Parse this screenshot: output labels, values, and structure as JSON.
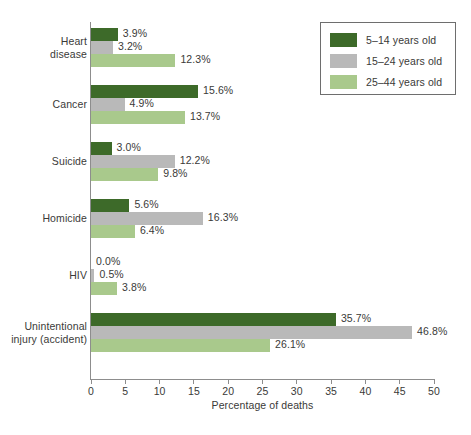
{
  "chart_data": {
    "type": "bar",
    "orientation": "horizontal",
    "title": "",
    "xlabel": "Percentage of deaths",
    "ylabel": "",
    "xlim": [
      0,
      50
    ],
    "xticks": [
      0,
      5,
      10,
      15,
      20,
      25,
      30,
      35,
      40,
      45,
      50
    ],
    "grid": false,
    "legend_position": "top-right",
    "categories": [
      "Heart disease",
      "Cancer",
      "Suicide",
      "Homicide",
      "HIV",
      "Unintentional injury (accident)"
    ],
    "category_label_lines": [
      [
        "Heart",
        "disease"
      ],
      [
        "Cancer"
      ],
      [
        "Suicide"
      ],
      [
        "Homicide"
      ],
      [
        "HIV"
      ],
      [
        "Unintentional",
        "injury (accident)"
      ]
    ],
    "series": [
      {
        "name": "5–14 years old",
        "color": "#3d6a29",
        "values": [
          3.9,
          15.6,
          3.0,
          5.6,
          0.0,
          35.7
        ],
        "labels": [
          "3.9%",
          "15.6%",
          "3.0%",
          "5.6%",
          "0.0%",
          "35.7%"
        ]
      },
      {
        "name": "15–24 years old",
        "color": "#b9b9b9",
        "values": [
          3.2,
          4.9,
          12.2,
          16.3,
          0.5,
          46.8
        ],
        "labels": [
          "3.2%",
          "4.9%",
          "12.2%",
          "16.3%",
          "0.5%",
          "46.8%"
        ]
      },
      {
        "name": "25–44 years old",
        "color": "#a9c98c",
        "values": [
          12.3,
          13.7,
          9.8,
          6.4,
          3.8,
          26.1
        ],
        "labels": [
          "12.3%",
          "13.7%",
          "9.8%",
          "6.4%",
          "3.8%",
          "26.1%"
        ]
      }
    ]
  },
  "legend": {
    "items": [
      {
        "label": "5–14 years old",
        "color": "#3d6a29"
      },
      {
        "label": "15–24 years old",
        "color": "#b9b9b9"
      },
      {
        "label": "25–44 years old",
        "color": "#a9c98c"
      }
    ]
  },
  "axis": {
    "x_title": "Percentage of deaths",
    "x_tick_labels": [
      "0",
      "5",
      "10",
      "15",
      "20",
      "25",
      "30",
      "35",
      "40",
      "45",
      "50"
    ]
  },
  "colors": {
    "series_1": "#3d6a29",
    "series_2": "#b9b9b9",
    "series_3": "#a9c98c",
    "axis": "#8d8d8d",
    "text": "#3a3a38",
    "background": "#ffffff"
  }
}
